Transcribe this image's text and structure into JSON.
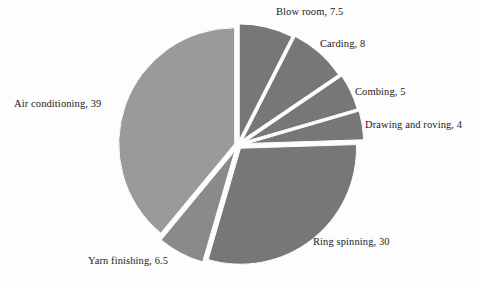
{
  "figure": {
    "background_color": "#fdfdfd",
    "text_color": "#1a1a1a"
  },
  "chart_data": {
    "type": "pie",
    "title": "",
    "subtitle": "",
    "xlabel": "",
    "ylabel": "",
    "total": 100,
    "units": "percent",
    "start_angle_deg": 0,
    "direction": "clockwise",
    "exploded": true,
    "legend_position": "none",
    "labels_position": "outside-callout",
    "grid": false,
    "categories": [
      "Blow room",
      "Carding",
      "Combing",
      "Drawing and roving",
      "Ring spinning",
      "Yarn finishing",
      "Air conditioning"
    ],
    "values": [
      7.5,
      8,
      5,
      4,
      30,
      6.5,
      39
    ],
    "colors": [
      "#77777a",
      "#77777a",
      "#77777a",
      "#77777a",
      "#77777a",
      "#8a8a8d",
      "#9a9a9d"
    ],
    "slices": [
      {
        "name": "Blow room",
        "value": 7.5,
        "label": "Blow room, 7.5",
        "color": "#77777a",
        "start_angle": 0,
        "end_angle": 27,
        "explode": 0.045
      },
      {
        "name": "Carding",
        "value": 8,
        "label": "Carding, 8",
        "color": "#77777a",
        "start_angle": 27,
        "end_angle": 55.8,
        "explode": 0.06
      },
      {
        "name": "Combing",
        "value": 5,
        "label": "Combing, 5",
        "color": "#77777a",
        "start_angle": 55.8,
        "end_angle": 73.8,
        "explode": 0.075
      },
      {
        "name": "Drawing and roving",
        "value": 4,
        "label": "Drawing and roving, 4",
        "color": "#77777a",
        "start_angle": 73.8,
        "end_angle": 88.2,
        "explode": 0.085
      },
      {
        "name": "Ring spinning",
        "value": 30,
        "label": "Ring spinning, 30",
        "color": "#77777a",
        "start_angle": 88.2,
        "end_angle": 196.2,
        "explode": 0.035
      },
      {
        "name": "Yarn finishing",
        "value": 6.5,
        "label": "Yarn finishing, 6.5",
        "color": "#8a8a8d",
        "start_angle": 196.2,
        "end_angle": 219.6,
        "explode": 0.055
      },
      {
        "name": "Air conditioning",
        "value": 39,
        "label": "Air conditioning, 39",
        "color": "#9a9a9d",
        "start_angle": 219.6,
        "end_angle": 360,
        "explode": 0.03
      }
    ]
  },
  "labels": {
    "blow_room": "Blow room, 7.5",
    "carding": "Carding, 8",
    "combing": "Combing, 5",
    "drawing_and_roving": "Drawing and roving, 4",
    "ring_spinning": "Ring spinning, 30",
    "yarn_finishing": "Yarn finishing, 6.5",
    "air_conditioning": "Air conditioning, 39"
  }
}
